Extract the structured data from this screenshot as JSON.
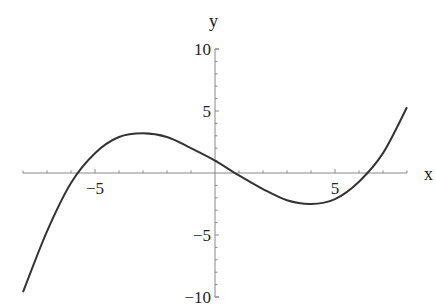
{
  "chart_data": {
    "type": "line",
    "title": "",
    "xlabel": "x",
    "ylabel": "y",
    "xlim": [
      -8,
      8
    ],
    "ylim": [
      -10,
      10
    ],
    "grid": false,
    "legend": null,
    "x_ticks": [
      -5,
      5
    ],
    "x_tick_labels": [
      "−5",
      "5"
    ],
    "y_ticks": [
      10,
      5,
      -5,
      -10
    ],
    "y_tick_labels": [
      "10",
      "5",
      "−5",
      "−10"
    ],
    "minor_tick_step_x": 1,
    "minor_tick_step_y": 1,
    "series": [
      {
        "name": "cubic curve",
        "x": [
          -8,
          -7,
          -6,
          -5,
          -4,
          -3,
          -2,
          -1,
          0,
          1,
          2,
          3,
          4,
          5,
          6,
          7,
          8
        ],
        "y": [
          -9.6,
          -4.7,
          -0.8,
          1.6,
          2.9,
          3.2,
          2.9,
          2.0,
          1.0,
          -0.2,
          -1.3,
          -2.2,
          -2.5,
          -2.1,
          -0.7,
          1.6,
          5.3
        ]
      }
    ],
    "annotations": {
      "local_max": [
        -3.0,
        3.2
      ],
      "local_min": [
        4.1,
        -2.5
      ],
      "roots": [
        -5.8,
        0.8,
        6.7
      ],
      "y_intercept": 1.0
    }
  }
}
